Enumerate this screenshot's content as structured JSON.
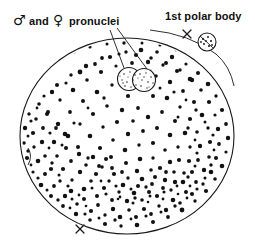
{
  "figure": {
    "width": 255,
    "height": 246,
    "background_color": "#ffffff",
    "ink_color": "#111111"
  },
  "labels": {
    "pronuclei": {
      "male_symbol": "♂",
      "conjunction": "and",
      "female_symbol": "♀",
      "noun": "pronuclei",
      "full_text": "♂ and ♀ pronuclei",
      "x": 14,
      "y": 24
    },
    "polar_body": {
      "text": "1st polar body",
      "x": 165,
      "y": 20
    }
  },
  "structures": {
    "cell": {
      "name": "zygote-cell-body",
      "center_x": 127,
      "center_y": 136,
      "radius_x": 107,
      "radius_y": 98,
      "fill": "#ffffff",
      "stroke": "#1a1a1a"
    },
    "pronucleus_male": {
      "name": "male-pronucleus",
      "center_x": 129,
      "center_y": 79,
      "radius": 11
    },
    "pronucleus_female": {
      "name": "female-pronucleus",
      "center_x": 143,
      "center_y": 80,
      "radius": 11
    },
    "polar_body": {
      "name": "first-polar-body",
      "center_x": 207,
      "center_y": 42,
      "radius": 9
    },
    "x_mark_top": {
      "name": "x-mark-top",
      "center_x": 187,
      "center_y": 34,
      "size": 6
    },
    "x_mark_bottom": {
      "name": "x-mark-bottom",
      "center_x": 80,
      "center_y": 229,
      "size": 6
    }
  },
  "annotations": {
    "leader_male": {
      "from_x": 112,
      "from_y": 31,
      "to_x": 125,
      "to_y": 69
    },
    "leader_female": {
      "from_x": 119,
      "from_y": 29,
      "to_x": 146,
      "to_y": 70
    }
  }
}
